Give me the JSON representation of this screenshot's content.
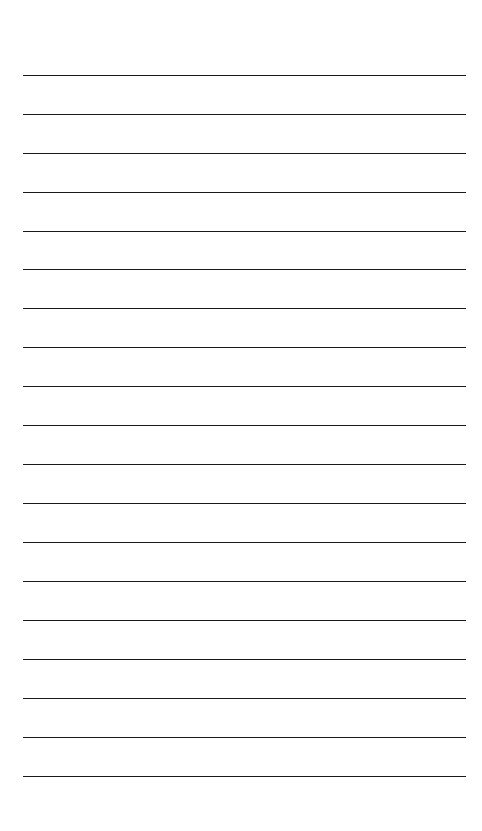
{
  "page": {
    "type": "lined-paper",
    "background": "#ffffff",
    "line_color": "#1a1a1a",
    "line_count": 19,
    "first_line_y": 75.5,
    "line_spacing": 38.94,
    "line_left": 23,
    "line_width": 443
  }
}
